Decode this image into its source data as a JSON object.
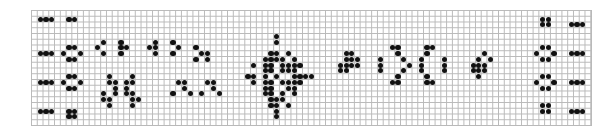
{
  "board": {
    "cols": 97,
    "rows": 20,
    "cell_w": 5.773,
    "cell_h": 5.75,
    "grid_color": "#b9b9b9",
    "cell_color": "#111111",
    "background": "#ffffff"
  },
  "live_cells_px": [
    [
      40,
      18
    ],
    [
      45,
      18
    ],
    [
      51,
      18
    ],
    [
      68,
      16
    ],
    [
      73,
      16
    ],
    [
      68,
      21
    ],
    [
      73,
      21
    ],
    [
      40,
      52
    ],
    [
      45,
      52
    ],
    [
      51,
      52
    ],
    [
      63,
      52
    ],
    [
      68,
      47
    ],
    [
      73,
      47
    ],
    [
      79,
      52
    ],
    [
      68,
      58
    ],
    [
      73,
      58
    ],
    [
      40,
      81
    ],
    [
      45,
      81
    ],
    [
      51,
      81
    ],
    [
      63,
      81
    ],
    [
      68,
      76
    ],
    [
      73,
      76
    ],
    [
      79,
      81
    ],
    [
      68,
      87
    ],
    [
      73,
      87
    ],
    [
      40,
      110
    ],
    [
      45,
      110
    ],
    [
      51,
      110
    ],
    [
      68,
      108
    ],
    [
      73,
      108
    ],
    [
      68,
      114
    ],
    [
      73,
      114
    ],
    [
      97,
      47
    ],
    [
      102,
      41
    ],
    [
      102,
      52
    ],
    [
      118,
      41
    ],
    [
      123,
      41
    ],
    [
      118,
      47
    ],
    [
      123,
      47
    ],
    [
      128,
      47
    ],
    [
      118,
      52
    ],
    [
      123,
      52
    ],
    [
      148,
      47
    ],
    [
      153,
      41
    ],
    [
      158,
      41
    ],
    [
      153,
      47
    ],
    [
      158,
      47
    ],
    [
      153,
      52
    ],
    [
      158,
      52
    ],
    [
      174,
      41
    ],
    [
      179,
      47
    ],
    [
      174,
      52
    ],
    [
      196,
      47
    ],
    [
      201,
      52
    ],
    [
      206,
      52
    ],
    [
      196,
      58
    ],
    [
      206,
      58
    ],
    [
      107,
      76
    ],
    [
      107,
      81
    ],
    [
      112,
      81
    ],
    [
      112,
      87
    ],
    [
      112,
      92
    ],
    [
      102,
      92
    ],
    [
      102,
      98
    ],
    [
      107,
      98
    ],
    [
      107,
      104
    ],
    [
      130,
      76
    ],
    [
      130,
      81
    ],
    [
      125,
      81
    ],
    [
      125,
      87
    ],
    [
      125,
      92
    ],
    [
      130,
      92
    ],
    [
      135,
      98
    ],
    [
      130,
      98
    ],
    [
      130,
      104
    ],
    [
      179,
      81
    ],
    [
      184,
      81
    ],
    [
      184,
      87
    ],
    [
      174,
      92
    ],
    [
      189,
      92
    ],
    [
      206,
      81
    ],
    [
      211,
      81
    ],
    [
      211,
      87
    ],
    [
      201,
      92
    ],
    [
      216,
      92
    ],
    [
      279,
      36
    ],
    [
      279,
      41
    ],
    [
      268,
      52
    ],
    [
      279,
      52
    ],
    [
      290,
      52
    ],
    [
      273,
      58
    ],
    [
      279,
      58
    ],
    [
      284,
      58
    ],
    [
      262,
      58
    ],
    [
      296,
      58
    ],
    [
      256,
      64
    ],
    [
      262,
      64
    ],
    [
      268,
      64
    ],
    [
      290,
      64
    ],
    [
      296,
      64
    ],
    [
      302,
      64
    ],
    [
      245,
      75
    ],
    [
      250,
      75
    ],
    [
      256,
      75
    ],
    [
      262,
      75
    ],
    [
      296,
      75
    ],
    [
      302,
      75
    ],
    [
      308,
      75
    ],
    [
      313,
      75
    ],
    [
      262,
      70
    ],
    [
      268,
      70
    ],
    [
      273,
      64
    ],
    [
      284,
      64
    ],
    [
      290,
      70
    ],
    [
      296,
      70
    ],
    [
      256,
      81
    ],
    [
      262,
      81
    ],
    [
      268,
      81
    ],
    [
      290,
      81
    ],
    [
      296,
      81
    ],
    [
      302,
      81
    ],
    [
      262,
      87
    ],
    [
      268,
      87
    ],
    [
      273,
      92
    ],
    [
      284,
      92
    ],
    [
      290,
      87
    ],
    [
      296,
      87
    ],
    [
      262,
      92
    ],
    [
      296,
      92
    ],
    [
      273,
      98
    ],
    [
      279,
      98
    ],
    [
      284,
      98
    ],
    [
      268,
      104
    ],
    [
      279,
      104
    ],
    [
      290,
      104
    ],
    [
      279,
      110
    ],
    [
      279,
      115
    ],
    [
      273,
      70
    ],
    [
      284,
      70
    ],
    [
      273,
      81
    ],
    [
      284,
      81
    ],
    [
      279,
      75
    ],
    [
      345,
      52
    ],
    [
      351,
      52
    ],
    [
      345,
      58
    ],
    [
      351,
      58
    ],
    [
      356,
      58
    ],
    [
      340,
      64
    ],
    [
      345,
      64
    ],
    [
      351,
      64
    ],
    [
      356,
      64
    ],
    [
      340,
      70
    ],
    [
      345,
      70
    ],
    [
      381,
      58
    ],
    [
      381,
      64
    ],
    [
      381,
      70
    ],
    [
      391,
      47
    ],
    [
      396,
      47
    ],
    [
      396,
      52
    ],
    [
      401,
      58
    ],
    [
      407,
      64
    ],
    [
      401,
      70
    ],
    [
      396,
      75
    ],
    [
      396,
      81
    ],
    [
      391,
      81
    ],
    [
      418,
      64
    ],
    [
      423,
      58
    ],
    [
      428,
      52
    ],
    [
      428,
      47
    ],
    [
      434,
      47
    ],
    [
      423,
      70
    ],
    [
      428,
      75
    ],
    [
      428,
      81
    ],
    [
      434,
      81
    ],
    [
      444,
      58
    ],
    [
      444,
      64
    ],
    [
      444,
      70
    ],
    [
      485,
      52
    ],
    [
      491,
      58
    ],
    [
      480,
      58
    ],
    [
      475,
      64
    ],
    [
      480,
      64
    ],
    [
      485,
      64
    ],
    [
      475,
      70
    ],
    [
      480,
      70
    ],
    [
      485,
      70
    ],
    [
      480,
      75
    ],
    [
      544,
      18
    ],
    [
      549,
      18
    ],
    [
      544,
      24
    ],
    [
      549,
      24
    ],
    [
      570,
      24
    ],
    [
      575,
      24
    ],
    [
      581,
      24
    ],
    [
      539,
      52
    ],
    [
      544,
      47
    ],
    [
      549,
      47
    ],
    [
      555,
      52
    ],
    [
      544,
      58
    ],
    [
      549,
      58
    ],
    [
      570,
      52
    ],
    [
      575,
      52
    ],
    [
      581,
      52
    ],
    [
      539,
      81
    ],
    [
      544,
      76
    ],
    [
      549,
      76
    ],
    [
      555,
      81
    ],
    [
      544,
      87
    ],
    [
      549,
      87
    ],
    [
      570,
      81
    ],
    [
      575,
      81
    ],
    [
      581,
      81
    ],
    [
      544,
      104
    ],
    [
      549,
      104
    ],
    [
      544,
      110
    ],
    [
      549,
      110
    ],
    [
      570,
      110
    ],
    [
      575,
      110
    ],
    [
      581,
      110
    ]
  ]
}
